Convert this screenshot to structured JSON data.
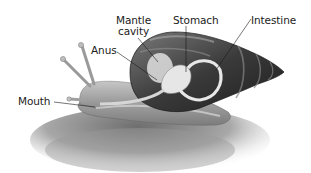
{
  "diagram": {
    "style": "grayscale illustration",
    "colors": {
      "background": "#ffffff",
      "label_text": "#222222",
      "leader_line": "#1a1a1a",
      "shell_dark": "#2e2e2e",
      "shell_light": "#9a9a9a",
      "body": "#b8b8b8",
      "organ": "#e4e4e4",
      "ground": "#8a8a8a"
    },
    "labels": {
      "mantle_cavity_line1": "Mantle",
      "mantle_cavity_line2": "cavity",
      "anus": "Anus",
      "stomach": "Stomach",
      "intestine": "Intestine",
      "mouth": "Mouth"
    }
  }
}
